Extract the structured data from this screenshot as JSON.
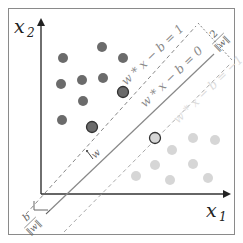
{
  "axes": {
    "x_label": "x",
    "x_sub": "1",
    "y_label": "x",
    "y_sub": "2"
  },
  "lines": {
    "upper_margin": "w * x − b = 1",
    "hyperplane": "w * x − b = 0",
    "lower_margin": "w * x − b = −1"
  },
  "annotations": {
    "margin_num": "2",
    "margin_den": "‖w‖",
    "offset_num": "b",
    "offset_den": "‖w‖",
    "normal_vector": "w"
  },
  "colors": {
    "class_a": "#6b6b6b",
    "class_b": "#d6d6d6",
    "frame": "#8a8a8a",
    "axis": "#333333",
    "line": "#777777",
    "label_dark": "#888888",
    "label_light": "#dddddd"
  },
  "points": {
    "class_a": [
      {
        "x": 102,
        "y": 47,
        "support": false
      },
      {
        "x": 63,
        "y": 58,
        "support": false
      },
      {
        "x": 123,
        "y": 58,
        "support": false
      },
      {
        "x": 61,
        "y": 84,
        "support": false
      },
      {
        "x": 82,
        "y": 80,
        "support": false
      },
      {
        "x": 103,
        "y": 78,
        "support": false
      },
      {
        "x": 83,
        "y": 101,
        "support": false
      },
      {
        "x": 62,
        "y": 120,
        "support": false
      },
      {
        "x": 92,
        "y": 127,
        "support": true
      },
      {
        "x": 123,
        "y": 92,
        "support": true
      }
    ],
    "class_b": [
      {
        "x": 193,
        "y": 138,
        "support": false
      },
      {
        "x": 215,
        "y": 140,
        "support": false
      },
      {
        "x": 172,
        "y": 150,
        "support": false
      },
      {
        "x": 155,
        "y": 165,
        "support": false
      },
      {
        "x": 193,
        "y": 164,
        "support": false
      },
      {
        "x": 136,
        "y": 176,
        "support": false
      },
      {
        "x": 170,
        "y": 180,
        "support": false
      },
      {
        "x": 208,
        "y": 178,
        "support": false
      },
      {
        "x": 155,
        "y": 138,
        "support": true
      }
    ]
  }
}
